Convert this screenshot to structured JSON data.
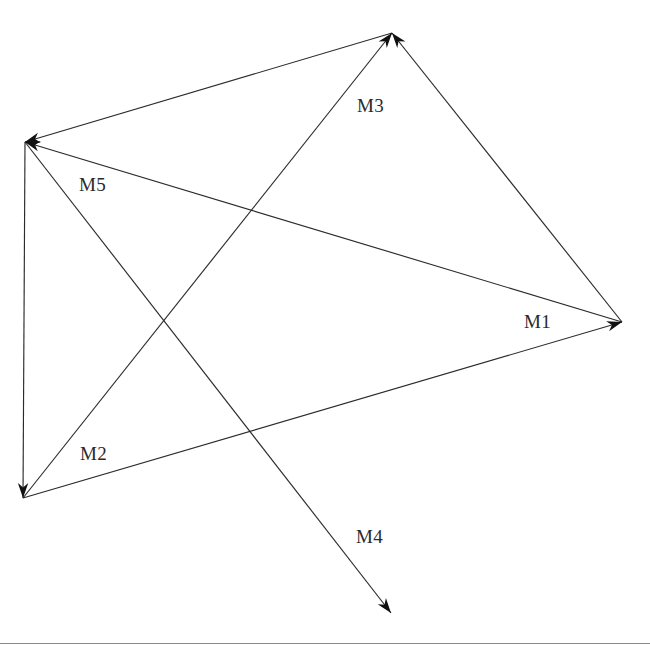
{
  "figure": {
    "background_color": "#ffffff",
    "line_color": "#2b2b2b",
    "arrow_color": "#111111",
    "label_color": "#2a2a2a",
    "rule_color": "#8a8a8a",
    "width": 650,
    "height": 649
  },
  "footer_rule": {
    "y": 643,
    "x1": 0,
    "x2": 650
  },
  "chart_data": {
    "type": "diagram",
    "xlabel": "",
    "ylabel": "",
    "xlim": [
      0,
      650
    ],
    "ylim": [
      0,
      649
    ],
    "grid": false,
    "legend": "none",
    "nodes": [
      {
        "id": "A",
        "name": "top-vertex",
        "x": 392,
        "y": 33
      },
      {
        "id": "B",
        "name": "left-vertex",
        "x": 25,
        "y": 142
      },
      {
        "id": "C",
        "name": "right-vertex",
        "x": 622,
        "y": 322
      },
      {
        "id": "D",
        "name": "bottom-left-vertex",
        "x": 23,
        "y": 498
      },
      {
        "id": "E",
        "name": "bottom-endpoint",
        "x": 391,
        "y": 613
      }
    ],
    "edges": [
      {
        "id": "e1",
        "label": "M3",
        "from": "D",
        "to": "A",
        "directed": true,
        "x1": 23,
        "y1": 498,
        "x2": 392,
        "y2": 33,
        "label_x": 357,
        "label_y": 96
      },
      {
        "id": "e2",
        "label": "M1",
        "from": "D",
        "to": "C",
        "directed": true,
        "x1": 23,
        "y1": 498,
        "x2": 622,
        "y2": 322,
        "label_x": 524,
        "label_y": 312
      },
      {
        "id": "e3",
        "label": "M2",
        "from": "B",
        "to": "D",
        "directed": true,
        "x1": 25,
        "y1": 142,
        "x2": 23,
        "y2": 498,
        "label_x": 80,
        "label_y": 444
      },
      {
        "id": "e4",
        "label": "M4",
        "from": "B",
        "to": "E",
        "directed": true,
        "x1": 25,
        "y1": 142,
        "x2": 391,
        "y2": 613,
        "label_x": 356,
        "label_y": 527
      },
      {
        "id": "e5",
        "label": "M5",
        "from": "C",
        "to": "B",
        "directed": true,
        "x1": 622,
        "y1": 322,
        "x2": 25,
        "y2": 142,
        "label_x": 79,
        "label_y": 175
      },
      {
        "id": "e6",
        "label": "",
        "from": "C",
        "to": "A",
        "directed": true,
        "x1": 622,
        "y1": 322,
        "x2": 392,
        "y2": 33,
        "label_x": 0,
        "label_y": 0
      },
      {
        "id": "e7",
        "label": "",
        "from": "A",
        "to": "B",
        "directed": true,
        "x1": 392,
        "y1": 33,
        "x2": 25,
        "y2": 142,
        "label_x": 0,
        "label_y": 0
      }
    ],
    "labels": [
      {
        "text": "M3",
        "x": 357,
        "y": 96
      },
      {
        "text": "M5",
        "x": 79,
        "y": 175
      },
      {
        "text": "M1",
        "x": 524,
        "y": 312
      },
      {
        "text": "M2",
        "x": 80,
        "y": 444
      },
      {
        "text": "M4",
        "x": 356,
        "y": 527
      }
    ]
  }
}
